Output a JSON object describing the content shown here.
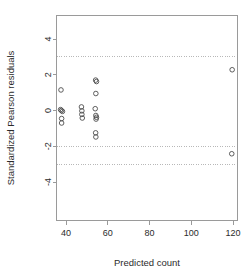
{
  "chart_data": {
    "type": "scatter",
    "title": "",
    "xlabel": "Predicted count",
    "ylabel": "Standardized Pearson residuals",
    "xlim": [
      32,
      128
    ],
    "ylim": [
      -5.3,
      5.3
    ],
    "xticks": [
      40,
      60,
      80,
      100,
      120
    ],
    "yticks": [
      4,
      2,
      0,
      -2,
      -4
    ],
    "xticklabels": [
      "40",
      "60",
      "80",
      "100",
      "120"
    ],
    "yticklabels": [
      "4",
      "2",
      "0",
      "-2",
      "-4"
    ],
    "grid": false,
    "legend": null,
    "reference_lines": {
      "type": "horizontal-dotted",
      "values": [
        3,
        -2,
        -3
      ],
      "color": "#b8b8b8"
    },
    "point_style": {
      "marker": "open-circle",
      "radius": 2.3,
      "stroke": "#4d4d4d"
    },
    "points": [
      {
        "x": 37.6,
        "y": 1.15
      },
      {
        "x": 37.4,
        "y": 0.05
      },
      {
        "x": 37.8,
        "y": 0.0
      },
      {
        "x": 38.3,
        "y": -0.05
      },
      {
        "x": 37.9,
        "y": -0.45
      },
      {
        "x": 37.9,
        "y": -0.7
      },
      {
        "x": 47.4,
        "y": 0.2
      },
      {
        "x": 47.6,
        "y": -0.02
      },
      {
        "x": 47.6,
        "y": -0.22
      },
      {
        "x": 47.8,
        "y": -0.42
      },
      {
        "x": 54.2,
        "y": 1.7
      },
      {
        "x": 54.6,
        "y": 1.62
      },
      {
        "x": 54.3,
        "y": 0.95
      },
      {
        "x": 54.0,
        "y": 0.1
      },
      {
        "x": 54.3,
        "y": -0.28
      },
      {
        "x": 54.6,
        "y": -0.38
      },
      {
        "x": 54.4,
        "y": -0.48
      },
      {
        "x": 54.2,
        "y": -1.25
      },
      {
        "x": 54.3,
        "y": -1.48
      },
      {
        "x": 119.6,
        "y": 2.28
      },
      {
        "x": 119.4,
        "y": -2.42
      }
    ]
  }
}
